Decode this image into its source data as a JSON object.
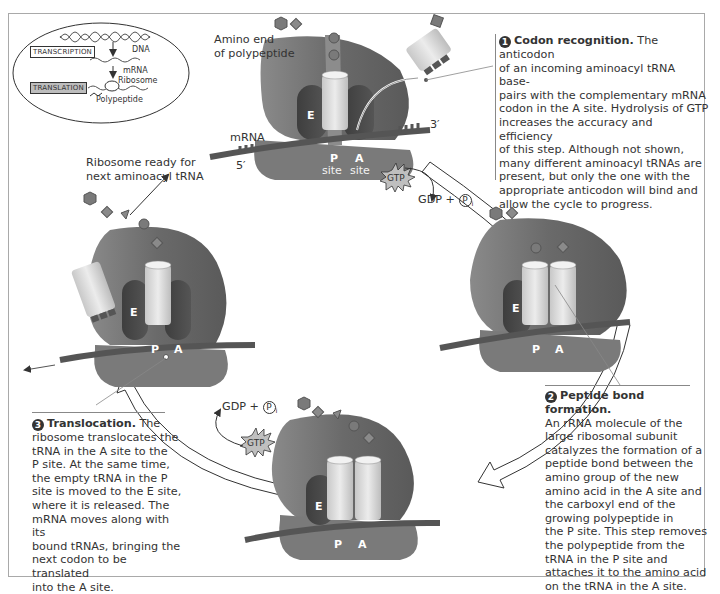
{
  "inset": {
    "dna_label": "DNA",
    "mrna_label": "mRNA",
    "ribosome_label": "Ribosome",
    "polypeptide_label": "Polypeptide",
    "transcription_label": "TRANSCRIPTION",
    "translation_label": "TRANSLATION"
  },
  "labels": {
    "amino_end": [
      "Amino end",
      "of polypeptide"
    ],
    "mrna": "mRNA",
    "five_prime": "5′",
    "three_prime": "3′",
    "ribosome_ready": [
      "Ribosome ready for",
      "next aminoacyl tRNA"
    ],
    "gtp": "GTP",
    "gdp_pi": "GDP + ",
    "pi": "P",
    "pi_sub": "i"
  },
  "sites": {
    "E": "E",
    "P": "P",
    "A": "A",
    "site": "site"
  },
  "steps": [
    {
      "number": "1",
      "title": "Codon recognition.",
      "lines": [
        " The anticodon",
        "of an incoming aminoacyl tRNA base-",
        "pairs with the complementary mRNA",
        "codon in the A site. Hydrolysis of GTP",
        "increases the accuracy and efficiency",
        "of this step. Although not shown,",
        "many different aminoacyl tRNAs are",
        "present, but only the one with the",
        "appropriate anticodon will bind and",
        "allow the cycle to progress."
      ]
    },
    {
      "number": "2",
      "title": "Peptide bond formation.",
      "lines": [
        "An rRNA molecule of the",
        "large ribosomal subunit",
        "catalyzes the formation of a",
        "peptide bond between the",
        "amino group of the new",
        "amino acid in the A site and",
        "the carboxyl end of the",
        "growing polypeptide in",
        "the P site. This step removes",
        "the polypeptide from the",
        "tRNA in the P site and",
        "attaches it to the amino acid",
        "on the tRNA in the A site."
      ]
    },
    {
      "number": "3",
      "title": "Translocation.",
      "lines": [
        " The",
        "ribosome translocates the",
        "tRNA in the A site to the",
        "P site. At the same time,",
        "the empty tRNA in the P",
        "site is moved to the E site,",
        "where it is released. The",
        "mRNA moves along with its",
        "bound tRNAs, bringing the",
        "next codon to be translated",
        "into the A site."
      ]
    }
  ],
  "colors": {
    "ribosome_large": "#6e6e6e",
    "ribosome_small": "#7a7a7a",
    "e_site": "#4a4a4a",
    "trna": "#dcdcdc",
    "mrna": "#5a5a5a",
    "frame": "#a9a9a9"
  }
}
